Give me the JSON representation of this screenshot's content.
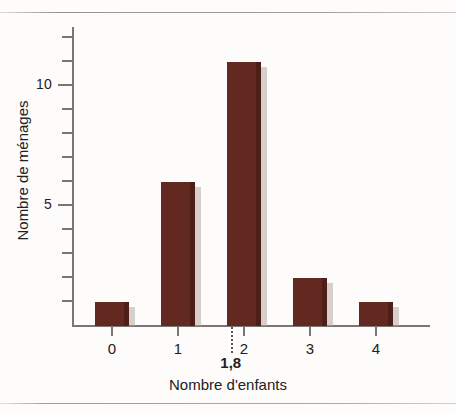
{
  "chart_data": {
    "type": "bar",
    "title": "",
    "xlabel": "Nombre d'enfants",
    "ylabel": "Nombre de ménages",
    "categories": [
      "0",
      "1",
      "2",
      "3",
      "4"
    ],
    "values": [
      1,
      6,
      11,
      2,
      1
    ],
    "series": [
      {
        "name": "Nombre de ménages",
        "values": [
          1,
          6,
          11,
          2,
          1
        ]
      }
    ],
    "ylim": [
      0,
      12.5
    ],
    "xlim": [
      -0.7,
      4.8
    ],
    "y_tick_labels": [
      "5",
      "10"
    ],
    "y_labelled_ticks": [
      5,
      10
    ],
    "y_minor_ticks": [
      1,
      2,
      3,
      4,
      6,
      7,
      8,
      9,
      11,
      12
    ],
    "x_tick_labels": [
      "0",
      "1",
      "2",
      "3",
      "4"
    ],
    "grid": false,
    "legend": false,
    "legend_position": "none",
    "bar_color": "#63281f",
    "axis_color": "#7d7572",
    "text_color": "#24201e",
    "annotations": [
      {
        "name": "mean-marker",
        "label": "1,8",
        "x_value": 1.8,
        "style": "dotted-vertical-line"
      }
    ]
  },
  "axes": {
    "y_ticks": [
      {
        "value": 12,
        "label": "",
        "major": false
      },
      {
        "value": 11,
        "label": "",
        "major": false
      },
      {
        "value": 10,
        "label": "10",
        "major": true
      },
      {
        "value": 9,
        "label": "",
        "major": false
      },
      {
        "value": 8,
        "label": "",
        "major": false
      },
      {
        "value": 7,
        "label": "",
        "major": false
      },
      {
        "value": 6,
        "label": "",
        "major": false
      },
      {
        "value": 5,
        "label": "5",
        "major": true
      },
      {
        "value": 4,
        "label": "",
        "major": false
      },
      {
        "value": 3,
        "label": "",
        "major": false
      },
      {
        "value": 2,
        "label": "",
        "major": false
      },
      {
        "value": 1,
        "label": "",
        "major": false
      }
    ],
    "x_ticks": [
      {
        "value": 0,
        "label": "0"
      },
      {
        "value": 1,
        "label": "1"
      },
      {
        "value": 2,
        "label": "2"
      },
      {
        "value": 3,
        "label": "3"
      },
      {
        "value": 4,
        "label": "4"
      }
    ]
  },
  "titles": {
    "x_axis": "Nombre d'enfants",
    "y_axis": "Nombre de ménages"
  }
}
